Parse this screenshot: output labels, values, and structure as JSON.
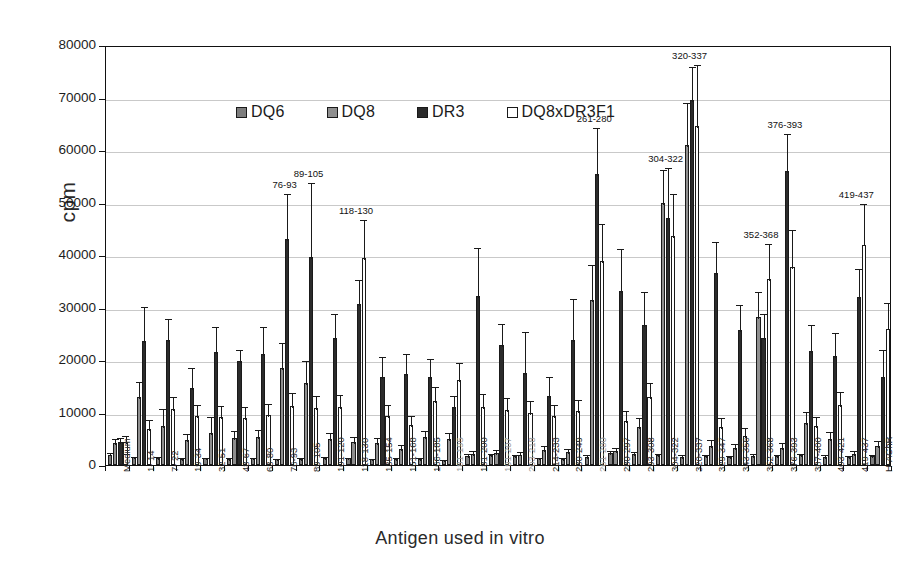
{
  "chart_data": {
    "type": "bar",
    "title": "",
    "xlabel": "Antigen used in vitro",
    "ylabel": "cpm",
    "ylim": [
      0,
      80000
    ],
    "ytick_step": 10000,
    "yticks": [
      "0",
      "10000",
      "20000",
      "30000",
      "40000",
      "50000",
      "60000",
      "70000",
      "80000"
    ],
    "grid": true,
    "legend_position": "top-left inside plot",
    "orientation": "vertical grouped",
    "categories": [
      "Medium",
      "1- 14",
      "7- 22",
      "19-34",
      "32-51",
      "48-67",
      "63-80",
      "76-93",
      "89-105",
      "101-120",
      "118-130",
      "135-154",
      "151-168",
      "166-185",
      "181-195",
      "181-200",
      "191-207",
      "203-218",
      "214-233",
      "230-249",
      "261-280",
      "280-297",
      "293-308",
      "304-322",
      "320-337",
      "329-347",
      "343-356",
      "352-368",
      "376-393",
      "387-400",
      "403-421",
      "419-437",
      "H-AChR"
    ],
    "category_faint": [
      "181-195",
      "191-207",
      "203-218",
      "261-280"
    ],
    "series": [
      {
        "name": "DQ6",
        "color": "#7d7d7d",
        "values": [
          2000,
          1500,
          1400,
          1200,
          1300,
          1200,
          1300,
          1100,
          1200,
          1400,
          1300,
          1100,
          1200,
          1200,
          1000,
          1800,
          1900,
          1700,
          1300,
          1200,
          1600,
          2300,
          2100,
          1900,
          1600,
          1700,
          1500,
          1800,
          1700,
          1900,
          1600,
          1500,
          1700
        ],
        "errors": [
          600,
          500,
          500,
          450,
          450,
          450,
          450,
          400,
          450,
          500,
          450,
          400,
          450,
          450,
          400,
          600,
          650,
          600,
          500,
          450,
          600,
          800,
          700,
          650,
          600,
          600,
          550,
          600,
          600,
          650,
          600,
          550,
          600
        ]
      },
      {
        "name": "DQ8",
        "color": "#8f8f8f",
        "values": [
          4200,
          13000,
          7500,
          4800,
          6100,
          5200,
          5300,
          18500,
          15600,
          5000,
          4400,
          4100,
          3100,
          5300,
          4900,
          2100,
          2300,
          2000,
          2900,
          2400,
          31500,
          2600,
          7200,
          50000,
          61000,
          3700,
          3200,
          28200,
          3300,
          8000,
          4900,
          2100,
          3700
        ]
      },
      {
        "name": "DR3",
        "color": "#2b2b2b",
        "values": [
          4300,
          23700,
          23800,
          14700,
          21500,
          19800,
          21100,
          43000,
          39600,
          24100,
          30700,
          16800,
          17400,
          16800,
          11000,
          32100,
          22800,
          17600,
          13100,
          23800,
          55500,
          33200,
          26700,
          47000,
          69500,
          36600,
          25800,
          24100,
          56000,
          21800,
          20700,
          32000,
          16800
        ]
      },
      {
        "name": "DQ8xDR3F1",
        "color": "#ffffff",
        "values": [
          4300,
          6900,
          10700,
          9300,
          9200,
          9000,
          9500,
          11200,
          10800,
          11000,
          39500,
          9400,
          7600,
          12200,
          16200,
          11100,
          10400,
          9900,
          9400,
          10200,
          38800,
          8400,
          12900,
          43600,
          64600,
          7200,
          5500,
          35500,
          37800,
          7400,
          11400,
          42000,
          26000
        ]
      }
    ],
    "series_errors": {
      "DQ8": [
        1200,
        3200,
        3500,
        1400,
        3400,
        1600,
        1700,
        5200,
        4600,
        1500,
        1400,
        1500,
        1100,
        1600,
        1500,
        900,
        900,
        800,
        1100,
        1000,
        7000,
        1100,
        2200,
        6500,
        8300,
        1400,
        1200,
        5200,
        1300,
        2500,
        1700,
        900,
        1300
      ],
      "DR3": [
        1300,
        6800,
        4300,
        4200,
        5100,
        2500,
        5600,
        9000,
        14500,
        5100,
        5000,
        4100,
        4200,
        3800,
        2600,
        9700,
        4500,
        8200,
        4000,
        8200,
        9000,
        8400,
        6600,
        10000,
        6600,
        6300,
        5000,
        5000,
        7500,
        5200,
        4800,
        5700,
        5500
      ]
    },
    "annotations": [
      {
        "category": "76-93",
        "label": "76-93"
      },
      {
        "category": "89-105",
        "label": "89-105"
      },
      {
        "category": "118-130",
        "label": "118-130"
      },
      {
        "category": "261-280",
        "label": "261-280"
      },
      {
        "category": "304-322",
        "label": "304-322"
      },
      {
        "category": "320-337",
        "label": "320-337"
      },
      {
        "category": "352-368",
        "label": "352-368"
      },
      {
        "category": "376-393",
        "label": "376-393"
      },
      {
        "category": "419-437",
        "label": "419-437"
      }
    ]
  },
  "legend": {
    "items": [
      {
        "label": "DQ6"
      },
      {
        "label": "DQ8"
      },
      {
        "label": "DR3"
      },
      {
        "label": "DQ8xDR3F1"
      }
    ]
  },
  "axes": {
    "y_title": "cpm",
    "x_title": "Antigen used in vitro"
  }
}
